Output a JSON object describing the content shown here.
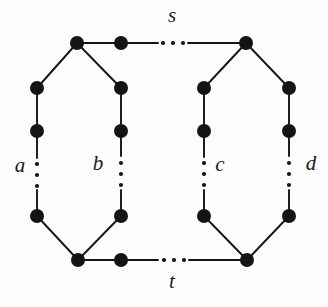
{
  "figure": {
    "background_color": "#fdfdfd",
    "node_color": "#141414",
    "edge_color": "#141414",
    "node_radius": 7,
    "width": 328,
    "height": 307
  },
  "labels": {
    "s": "s",
    "t": "t",
    "a": "a",
    "b": "b",
    "c": "c",
    "d": "d"
  },
  "label_positions": {
    "s": {
      "x": 172,
      "y": 17
    },
    "t": {
      "x": 172,
      "y": 283
    },
    "a": {
      "x": 20,
      "y": 167
    },
    "b": {
      "x": 98,
      "y": 165
    },
    "c": {
      "x": 220,
      "y": 166
    },
    "d": {
      "x": 311,
      "y": 165
    }
  },
  "nodes": [
    {
      "id": "s",
      "name": "node-s-top-left",
      "x": 77,
      "y": 43
    },
    {
      "id": "s2",
      "name": "node-s-top-second",
      "x": 121,
      "y": 43
    },
    {
      "id": "s3",
      "name": "node-s-top-right",
      "x": 246,
      "y": 43
    },
    {
      "id": "a1",
      "name": "node-a-upper",
      "x": 37,
      "y": 88
    },
    {
      "id": "a2",
      "name": "node-a-upper-mid",
      "x": 37,
      "y": 131
    },
    {
      "id": "a3",
      "name": "node-a-lower",
      "x": 37,
      "y": 216
    },
    {
      "id": "b1",
      "name": "node-b-upper",
      "x": 121,
      "y": 88
    },
    {
      "id": "b2",
      "name": "node-b-upper-mid",
      "x": 121,
      "y": 131
    },
    {
      "id": "b3",
      "name": "node-b-lower",
      "x": 121,
      "y": 216
    },
    {
      "id": "c1",
      "name": "node-c-upper",
      "x": 204,
      "y": 88
    },
    {
      "id": "c2",
      "name": "node-c-upper-mid",
      "x": 204,
      "y": 131
    },
    {
      "id": "c3",
      "name": "node-c-lower",
      "x": 204,
      "y": 216
    },
    {
      "id": "d1",
      "name": "node-d-upper",
      "x": 289,
      "y": 88
    },
    {
      "id": "d2",
      "name": "node-d-upper-mid",
      "x": 289,
      "y": 131
    },
    {
      "id": "d3",
      "name": "node-d-lower",
      "x": 289,
      "y": 216
    },
    {
      "id": "t",
      "name": "node-t-bottom-left",
      "x": 78,
      "y": 260
    },
    {
      "id": "t2",
      "name": "node-t-bottom-second",
      "x": 121,
      "y": 260
    },
    {
      "id": "t3",
      "name": "node-t-bottom-right",
      "x": 247,
      "y": 260
    }
  ],
  "edges": [
    {
      "name": "edge-s-to-s2",
      "x1": 77,
      "y1": 43,
      "x2": 121,
      "y2": 43
    },
    {
      "name": "edge-s2-to-gap",
      "x1": 121,
      "y1": 43,
      "x2": 158,
      "y2": 43
    },
    {
      "name": "edge-gap-to-s3",
      "x1": 188,
      "y1": 43,
      "x2": 246,
      "y2": 43
    },
    {
      "name": "edge-s-to-a1",
      "x1": 77,
      "y1": 43,
      "x2": 37,
      "y2": 88
    },
    {
      "name": "edge-s-to-b1",
      "x1": 77,
      "y1": 43,
      "x2": 121,
      "y2": 88
    },
    {
      "name": "edge-s3-to-c1",
      "x1": 246,
      "y1": 43,
      "x2": 204,
      "y2": 88
    },
    {
      "name": "edge-s3-to-d1",
      "x1": 246,
      "y1": 43,
      "x2": 289,
      "y2": 88
    },
    {
      "name": "edge-a1-to-a2",
      "x1": 37,
      "y1": 88,
      "x2": 37,
      "y2": 131
    },
    {
      "name": "edge-a2-to-gap",
      "x1": 37,
      "y1": 131,
      "x2": 37,
      "y2": 158
    },
    {
      "name": "edge-gap-to-a3",
      "x1": 37,
      "y1": 190,
      "x2": 37,
      "y2": 216
    },
    {
      "name": "edge-b1-to-b2",
      "x1": 121,
      "y1": 88,
      "x2": 121,
      "y2": 131
    },
    {
      "name": "edge-b2-to-gap",
      "x1": 121,
      "y1": 131,
      "x2": 121,
      "y2": 156
    },
    {
      "name": "edge-gap-to-b3",
      "x1": 121,
      "y1": 190,
      "x2": 121,
      "y2": 216
    },
    {
      "name": "edge-c1-to-c2",
      "x1": 204,
      "y1": 88,
      "x2": 204,
      "y2": 131
    },
    {
      "name": "edge-c2-to-gap",
      "x1": 204,
      "y1": 131,
      "x2": 204,
      "y2": 157
    },
    {
      "name": "edge-gap-to-c3",
      "x1": 204,
      "y1": 190,
      "x2": 204,
      "y2": 216
    },
    {
      "name": "edge-d1-to-d2",
      "x1": 289,
      "y1": 88,
      "x2": 289,
      "y2": 131
    },
    {
      "name": "edge-d2-to-gap",
      "x1": 289,
      "y1": 131,
      "x2": 289,
      "y2": 156
    },
    {
      "name": "edge-gap-to-d3",
      "x1": 289,
      "y1": 190,
      "x2": 289,
      "y2": 216
    },
    {
      "name": "edge-a3-to-t",
      "x1": 37,
      "y1": 216,
      "x2": 78,
      "y2": 260
    },
    {
      "name": "edge-b3-to-t",
      "x1": 121,
      "y1": 216,
      "x2": 78,
      "y2": 260
    },
    {
      "name": "edge-c3-to-t3",
      "x1": 204,
      "y1": 216,
      "x2": 247,
      "y2": 260
    },
    {
      "name": "edge-d3-to-t3",
      "x1": 289,
      "y1": 216,
      "x2": 247,
      "y2": 260
    },
    {
      "name": "edge-t-to-t2",
      "x1": 78,
      "y1": 260,
      "x2": 121,
      "y2": 260
    },
    {
      "name": "edge-t2-to-gap",
      "x1": 121,
      "y1": 260,
      "x2": 158,
      "y2": 260
    },
    {
      "name": "edge-gap-to-t3",
      "x1": 189,
      "y1": 260,
      "x2": 247,
      "y2": 260
    }
  ],
  "ellipses": [
    {
      "name": "ellipsis-top-horizontal",
      "orientation": "horizontal",
      "dots": [
        {
          "x": 163,
          "y": 43
        },
        {
          "x": 173,
          "y": 43
        },
        {
          "x": 183,
          "y": 43
        }
      ]
    },
    {
      "name": "ellipsis-bottom-horizontal",
      "orientation": "horizontal",
      "dots": [
        {
          "x": 164,
          "y": 260
        },
        {
          "x": 174,
          "y": 260
        },
        {
          "x": 184,
          "y": 260
        }
      ]
    },
    {
      "name": "ellipsis-column-a",
      "orientation": "vertical",
      "dots": [
        {
          "x": 37,
          "y": 164
        },
        {
          "x": 37,
          "y": 175
        },
        {
          "x": 37,
          "y": 186
        }
      ]
    },
    {
      "name": "ellipsis-column-b",
      "orientation": "vertical",
      "dots": [
        {
          "x": 121,
          "y": 163
        },
        {
          "x": 121,
          "y": 174
        },
        {
          "x": 121,
          "y": 185
        }
      ]
    },
    {
      "name": "ellipsis-column-c",
      "orientation": "vertical",
      "dots": [
        {
          "x": 204,
          "y": 163
        },
        {
          "x": 204,
          "y": 174
        },
        {
          "x": 204,
          "y": 185
        }
      ]
    },
    {
      "name": "ellipsis-column-d",
      "orientation": "vertical",
      "dots": [
        {
          "x": 289,
          "y": 163
        },
        {
          "x": 289,
          "y": 174
        },
        {
          "x": 289,
          "y": 185
        }
      ]
    }
  ]
}
